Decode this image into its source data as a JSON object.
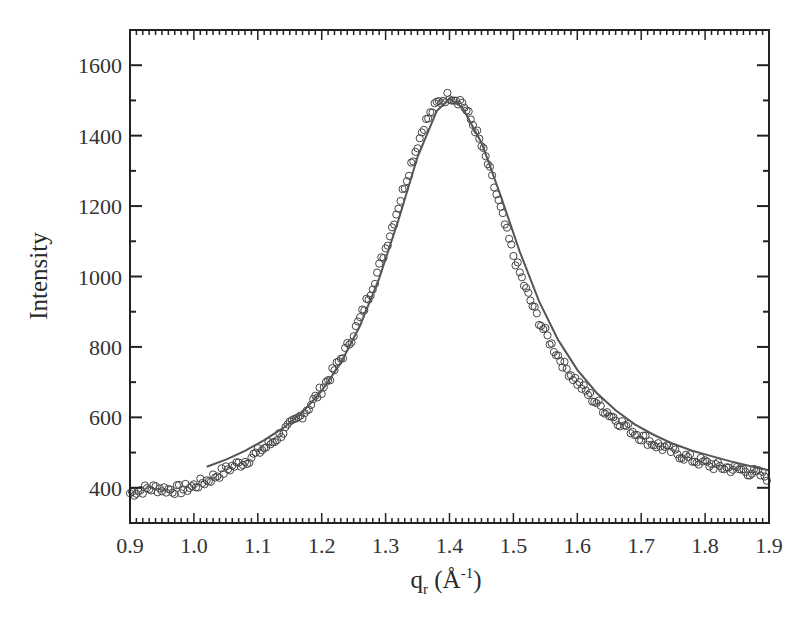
{
  "chart_data": {
    "type": "scatter",
    "title": "",
    "xlabel": "q_r (Å^-1)",
    "xlabel_parts": {
      "main": "q",
      "sub": "r",
      "unit_open": " (Å",
      "sup": "-1",
      "unit_close": ")"
    },
    "ylabel": "Intensity",
    "xlim": [
      0.9,
      1.9
    ],
    "ylim": [
      300,
      1700
    ],
    "xticks": [
      0.9,
      1.0,
      1.1,
      1.2,
      1.3,
      1.4,
      1.5,
      1.6,
      1.7,
      1.8,
      1.9
    ],
    "xtick_labels": [
      "0.9",
      "1.0",
      "1.1",
      "1.2",
      "1.3",
      "1.4",
      "1.5",
      "1.6",
      "1.7",
      "1.8",
      "1.9"
    ],
    "yticks": [
      400,
      600,
      800,
      1000,
      1200,
      1400,
      1600
    ],
    "ytick_labels": [
      "400",
      "600",
      "800",
      "1000",
      "1200",
      "1400",
      "1600"
    ],
    "y_minor_step": 100,
    "x_minor_step": 0.01,
    "grid": false,
    "legend": null,
    "series": [
      {
        "name": "data",
        "style": "open-circles",
        "x": [
          0.9,
          0.92,
          0.94,
          0.96,
          0.98,
          1.0,
          1.02,
          1.04,
          1.06,
          1.08,
          1.1,
          1.12,
          1.14,
          1.16,
          1.18,
          1.2,
          1.22,
          1.24,
          1.26,
          1.28,
          1.3,
          1.32,
          1.34,
          1.36,
          1.38,
          1.4,
          1.42,
          1.44,
          1.46,
          1.48,
          1.5,
          1.52,
          1.54,
          1.56,
          1.58,
          1.6,
          1.62,
          1.64,
          1.66,
          1.68,
          1.7,
          1.72,
          1.74,
          1.76,
          1.78,
          1.8,
          1.82,
          1.84,
          1.86,
          1.88,
          1.9
        ],
        "y": [
          385,
          395,
          400,
          395,
          395,
          405,
          420,
          440,
          460,
          475,
          500,
          525,
          560,
          590,
          630,
          680,
          735,
          800,
          880,
          975,
          1080,
          1200,
          1320,
          1430,
          1490,
          1515,
          1495,
          1420,
          1320,
          1190,
          1060,
          960,
          875,
          805,
          745,
          700,
          660,
          625,
          595,
          570,
          545,
          525,
          510,
          495,
          480,
          470,
          460,
          455,
          450,
          440,
          430
        ]
      },
      {
        "name": "fit",
        "style": "solid-line",
        "x": [
          1.02,
          1.05,
          1.08,
          1.11,
          1.14,
          1.17,
          1.2,
          1.23,
          1.26,
          1.29,
          1.32,
          1.35,
          1.38,
          1.4,
          1.42,
          1.45,
          1.48,
          1.51,
          1.54,
          1.57,
          1.6,
          1.63,
          1.66,
          1.69,
          1.72,
          1.75,
          1.78,
          1.81,
          1.84,
          1.87,
          1.9
        ],
        "y": [
          460,
          480,
          505,
          535,
          570,
          615,
          675,
          755,
          860,
          995,
          1160,
          1340,
          1470,
          1505,
          1480,
          1380,
          1230,
          1070,
          930,
          820,
          735,
          670,
          620,
          580,
          550,
          525,
          505,
          490,
          475,
          462,
          450
        ]
      }
    ]
  }
}
